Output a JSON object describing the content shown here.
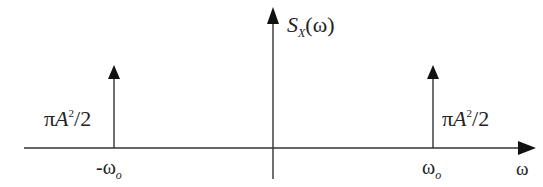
{
  "diagram": {
    "y_axis_label": {
      "main": "S",
      "sub": "X",
      "arg": "(ω)"
    },
    "x_axis_label": "ω",
    "impulses": [
      {
        "position_label": {
          "sign": "-",
          "main": "ω",
          "sub": "o"
        },
        "amplitude_label": {
          "pi": "π",
          "var": "A",
          "exp": "2",
          "div": "/2"
        }
      },
      {
        "position_label": {
          "sign": "",
          "main": "ω",
          "sub": "o"
        },
        "amplitude_label": {
          "pi": "π",
          "var": "A",
          "exp": "2",
          "div": "/2"
        }
      }
    ],
    "colors": {
      "line": "#333333",
      "text": "#222222",
      "background": "#ffffff"
    }
  }
}
